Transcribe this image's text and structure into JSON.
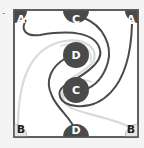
{
  "puzzle": {
    "marker": "-",
    "nodes": [
      {
        "id": "a-top-left",
        "label": "A"
      },
      {
        "id": "c-top",
        "label": "C"
      },
      {
        "id": "a-top-right",
        "label": "A"
      },
      {
        "id": "d-center",
        "label": "D"
      },
      {
        "id": "c-center",
        "label": "C"
      },
      {
        "id": "b-bottom-left",
        "label": "B"
      },
      {
        "id": "d-bottom",
        "label": "D"
      },
      {
        "id": "b-bottom-right",
        "label": "B"
      }
    ],
    "colors": {
      "dark": "#4a4a4a",
      "light": "#e6e6e6",
      "light_path": "#d8d8d8",
      "border": "#555555",
      "background": "#ffffff"
    }
  }
}
